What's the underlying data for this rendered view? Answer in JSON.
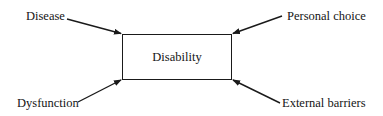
{
  "diagram": {
    "center": {
      "label": "Disability"
    },
    "factors": [
      {
        "id": "disease",
        "label": "Disease",
        "position": "top-left"
      },
      {
        "id": "personal-choice",
        "label": "Personal choice",
        "position": "top-right"
      },
      {
        "id": "dysfunction",
        "label": "Dysfunction",
        "position": "bottom-left"
      },
      {
        "id": "external-barriers",
        "label": "External barriers",
        "position": "bottom-right"
      }
    ],
    "colors": {
      "line": "#1a1a1a",
      "text": "#151515",
      "background": "#ffffff"
    }
  }
}
